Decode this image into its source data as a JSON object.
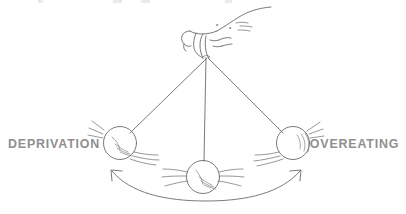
{
  "illustration": {
    "title": "Pendulum balance between deprivation and overeating",
    "style": "hand-drawn line illustration",
    "background_color": "#ffffff",
    "ink_color": "#6b6b6b",
    "label_color": "#8f8f8f",
    "labels": {
      "left": "DEPRIVATION",
      "right": "OVEREATING"
    },
    "pivot": {
      "name": "hand-pivot",
      "x": 207,
      "y": 58
    },
    "balls": [
      {
        "name": "left-ball",
        "label": "DEPRIVATION",
        "cx": 120,
        "cy": 143,
        "r": 16.5,
        "motion": "swinging"
      },
      {
        "name": "center-ball",
        "label": "",
        "cx": 203,
        "cy": 177,
        "r": 16.5,
        "motion": "swinging"
      },
      {
        "name": "right-ball",
        "label": "OVEREATING",
        "cx": 293,
        "cy": 143,
        "r": 16.5,
        "motion": "swinging"
      }
    ],
    "swing_arrow": {
      "name": "swing-arrow",
      "direction": "double-headed",
      "from_x": 112,
      "from_y": 170,
      "to_x": 300,
      "to_y": 170,
      "lowest_y": 201
    },
    "top_crop_fragments": [
      {
        "left": 38,
        "width": 5
      },
      {
        "left": 113,
        "width": 9
      },
      {
        "left": 141,
        "width": 9
      },
      {
        "left": 225,
        "width": 7
      }
    ]
  }
}
